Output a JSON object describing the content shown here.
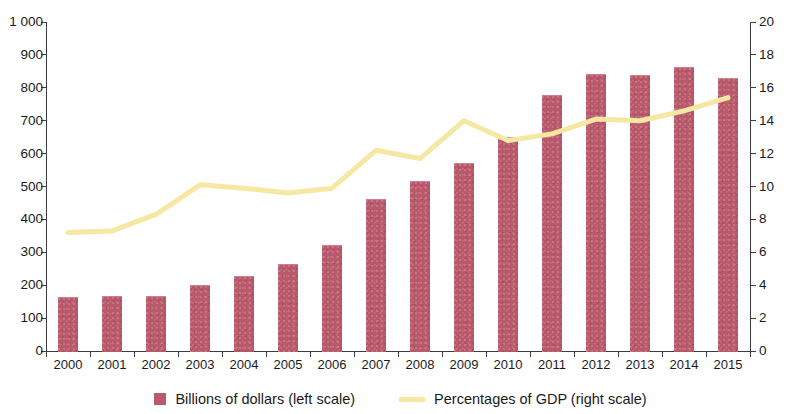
{
  "chart_data": {
    "type": "bar",
    "title": "",
    "subtitle": "",
    "xlabel": "",
    "ylabel": "",
    "grid": false,
    "legend_position": "bottom",
    "categories": [
      "2000",
      "2001",
      "2002",
      "2003",
      "2004",
      "2005",
      "2006",
      "2007",
      "2008",
      "2009",
      "2010",
      "2011",
      "2012",
      "2013",
      "2014",
      "2015"
    ],
    "axes": {
      "left": {
        "label": "Billions of dollars",
        "min": 0,
        "max": 1000,
        "step": 100,
        "ticks": [
          "0",
          "100",
          "200",
          "300",
          "400",
          "500",
          "600",
          "700",
          "800",
          "900",
          "1 000"
        ],
        "tick_values": [
          0,
          100,
          200,
          300,
          400,
          500,
          600,
          700,
          800,
          900,
          1000
        ]
      },
      "right": {
        "label": "Percentages of GDP",
        "min": 0,
        "max": 20,
        "step": 2,
        "ticks": [
          "0",
          "2",
          "4",
          "6",
          "8",
          "10",
          "12",
          "14",
          "16",
          "18",
          "20"
        ],
        "tick_values": [
          0,
          2,
          4,
          6,
          8,
          10,
          12,
          14,
          16,
          18,
          20
        ]
      }
    },
    "series": [
      {
        "name": "Billions of dollars (left scale)",
        "type": "bar",
        "axis": "left",
        "color": "#b9596b",
        "values": [
          165,
          167,
          166,
          200,
          227,
          263,
          322,
          463,
          517,
          570,
          650,
          778,
          842,
          838,
          862,
          830
        ]
      },
      {
        "name": "Percentages of GDP (right scale)",
        "type": "line",
        "axis": "right",
        "color": "#f6e7a2",
        "values": [
          7.2,
          7.3,
          8.3,
          10.1,
          9.9,
          9.6,
          9.9,
          12.2,
          11.7,
          14.0,
          12.8,
          13.2,
          14.1,
          14.0,
          14.6,
          15.4
        ]
      }
    ]
  },
  "legend": {
    "items": [
      {
        "label": "Billions of dollars (left scale)",
        "marker": "square-swatch",
        "color": "#b9596b"
      },
      {
        "label": "Percentages of GDP (right scale)",
        "marker": "line-swatch",
        "color": "#f6e7a2"
      }
    ]
  }
}
